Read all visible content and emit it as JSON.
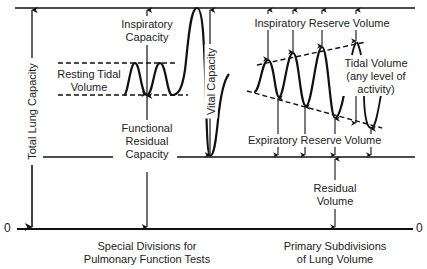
{
  "diagram": {
    "axis": {
      "zero_left": "0",
      "zero_right": "0"
    },
    "left_panel": {
      "caption_line1": "Special Divisions for",
      "caption_line2": "Pulmonary Function Tests",
      "labels": {
        "total_lung_capacity": "Total Lung Capacity",
        "inspiratory_capacity_1": "Inspiratory",
        "inspiratory_capacity_2": "Capacity",
        "resting_tidal_1": "Resting Tidal",
        "resting_tidal_2": "Volume",
        "frc_1": "Functional",
        "frc_2": "Residual",
        "frc_3": "Capacity",
        "vital_capacity": "Vital Capacity"
      }
    },
    "right_panel": {
      "caption_line1": "Primary Subdivisions",
      "caption_line2": "of Lung Volume",
      "labels": {
        "irv": "Inspiratory Reserve Volume",
        "tidal_1": "Tidal Volume",
        "tidal_2": "(any level of",
        "tidal_3": "activity)",
        "erv": "Expiratory Reserve Volume",
        "rv_1": "Residual",
        "rv_2": "Volume"
      }
    },
    "colors": {
      "line": "#111111",
      "background": "#ffffff"
    }
  }
}
